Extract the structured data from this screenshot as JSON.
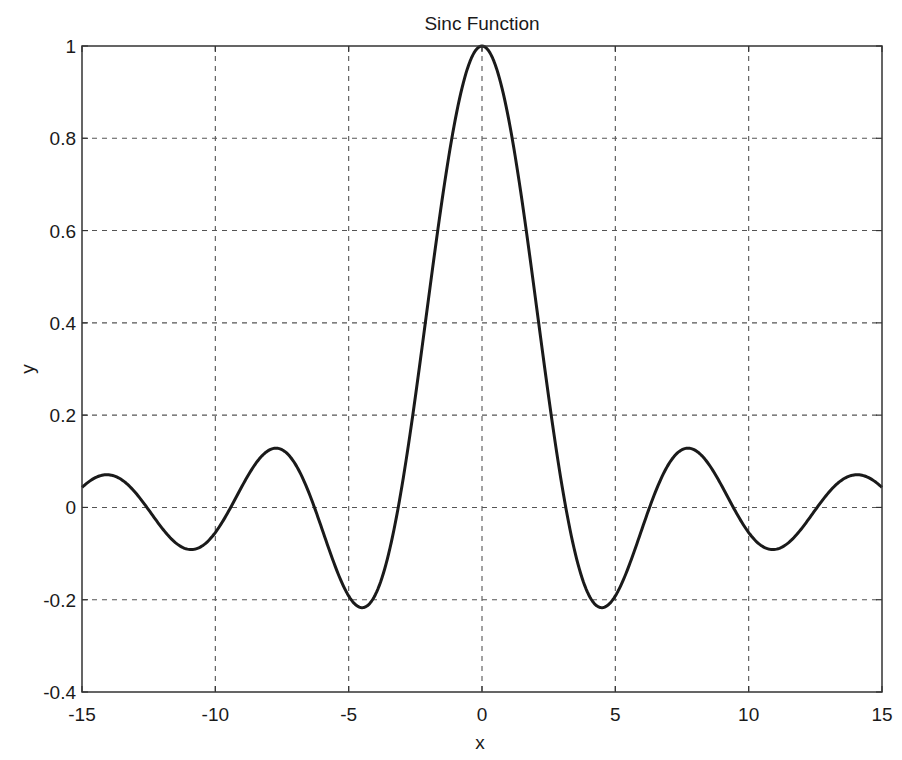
{
  "chart_data": {
    "type": "line",
    "title": "Sinc Function",
    "xlabel": "x",
    "ylabel": "y",
    "xlim": [
      -15,
      15
    ],
    "ylim": [
      -0.4,
      1
    ],
    "x_ticks": [
      -15,
      -10,
      -5,
      0,
      5,
      10,
      15
    ],
    "x_tick_labels": [
      "-15",
      "-10",
      "-5",
      "0",
      "5",
      "10",
      "15"
    ],
    "y_ticks": [
      -0.4,
      -0.2,
      0,
      0.2,
      0.4,
      0.6,
      0.8,
      1
    ],
    "y_tick_labels": [
      "-0.4",
      "-0.2",
      "0",
      "0.2",
      "0.4",
      "0.6",
      "0.8",
      "1"
    ],
    "grid": true,
    "grid_style": "dashed",
    "legend": null,
    "series": [
      {
        "name": "sinc(x) = sin(x)/x",
        "color": "#1a1a1a",
        "x": [
          -15,
          -14,
          -13,
          -12,
          -11,
          -10,
          -9,
          -8,
          -7.73,
          -7,
          -6,
          -5,
          -4.49,
          -4,
          -3,
          -2,
          -1,
          0,
          1,
          2,
          3,
          4,
          4.49,
          5,
          6,
          7,
          7.73,
          8,
          9,
          10,
          11,
          12,
          13,
          14,
          15
        ],
        "y": [
          0.043,
          0.071,
          0.032,
          -0.045,
          -0.091,
          -0.054,
          0.046,
          0.124,
          0.128,
          0.094,
          -0.047,
          -0.192,
          -0.217,
          -0.189,
          0.047,
          0.455,
          0.841,
          1.0,
          0.841,
          0.455,
          0.047,
          -0.189,
          -0.217,
          -0.192,
          -0.047,
          0.094,
          0.128,
          0.124,
          0.046,
          -0.054,
          -0.091,
          -0.045,
          0.032,
          0.071,
          0.043
        ]
      }
    ]
  },
  "plot": {
    "title": "Sinc Function",
    "xlabel": "x",
    "ylabel": "y",
    "colors": {
      "line": "#1a1a1a",
      "grid": "#555555",
      "axes": "#333333",
      "background": "#ffffff"
    }
  }
}
